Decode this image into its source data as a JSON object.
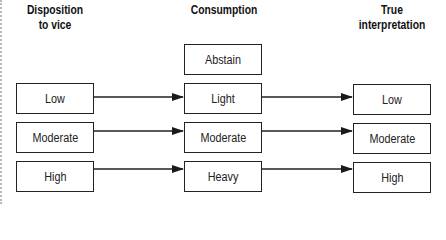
{
  "headers": {
    "disposition_line1": "Disposition",
    "disposition_line2": "to vice",
    "consumption": "Consumption",
    "interpretation_line1": "True",
    "interpretation_line2": "interpretation"
  },
  "columns": {
    "disposition": [
      "Low",
      "Moderate",
      "High"
    ],
    "consumption": [
      "Abstain",
      "Light",
      "Moderate",
      "Heavy"
    ],
    "interpretation": [
      "Low",
      "Moderate",
      "High"
    ]
  },
  "arrows": [
    {
      "from": "Low",
      "to": "Light"
    },
    {
      "from": "Moderate",
      "to": "Moderate"
    },
    {
      "from": "High",
      "to": "Heavy"
    },
    {
      "from": "Light",
      "to": "Low"
    },
    {
      "from": "Moderate",
      "to": "Moderate"
    },
    {
      "from": "Heavy",
      "to": "High"
    }
  ],
  "colors": {
    "line": "#222222",
    "background": "#ffffff"
  }
}
